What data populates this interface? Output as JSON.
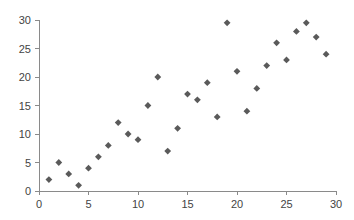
{
  "chart_data": {
    "type": "scatter",
    "title": "",
    "subtitle": "",
    "xlabel": "",
    "ylabel": "",
    "xlim": [
      0,
      30
    ],
    "ylim": [
      0,
      30
    ],
    "xticks": [
      0,
      5,
      10,
      15,
      20,
      25,
      30
    ],
    "yticks": [
      0,
      5,
      10,
      15,
      20,
      25,
      30
    ],
    "xtick_labels": [
      "0",
      "5",
      "10",
      "15",
      "20",
      "25",
      "30"
    ],
    "ytick_labels": [
      "0",
      "5",
      "10",
      "15",
      "20",
      "25",
      "30"
    ],
    "grid": false,
    "legend": null,
    "legend_position": "none",
    "marker": "diamond",
    "marker_color": "#5a5a5a",
    "axis_color": "#8a8a8a",
    "label_color": "#444444",
    "background": "#ffffff",
    "series": [
      {
        "name": "series-1",
        "points": [
          [
            1,
            2
          ],
          [
            2,
            5
          ],
          [
            3,
            3
          ],
          [
            4,
            1
          ],
          [
            5,
            4
          ],
          [
            6,
            6
          ],
          [
            7,
            8
          ],
          [
            8,
            12
          ],
          [
            9,
            10
          ],
          [
            10,
            9
          ],
          [
            11,
            15
          ],
          [
            12,
            20
          ],
          [
            13,
            7
          ],
          [
            14,
            11
          ],
          [
            15,
            17
          ],
          [
            16,
            16
          ],
          [
            17,
            19
          ],
          [
            18,
            13
          ],
          [
            19,
            29.5
          ],
          [
            20,
            21
          ],
          [
            21,
            14
          ],
          [
            22,
            18
          ],
          [
            23,
            22
          ],
          [
            24,
            26
          ],
          [
            25,
            23
          ],
          [
            26,
            28
          ],
          [
            27,
            29.5
          ],
          [
            28,
            27
          ],
          [
            29,
            24
          ]
        ]
      }
    ]
  },
  "plot_geometry": {
    "left": 39,
    "right": 336,
    "top": 20,
    "bottom": 191
  }
}
